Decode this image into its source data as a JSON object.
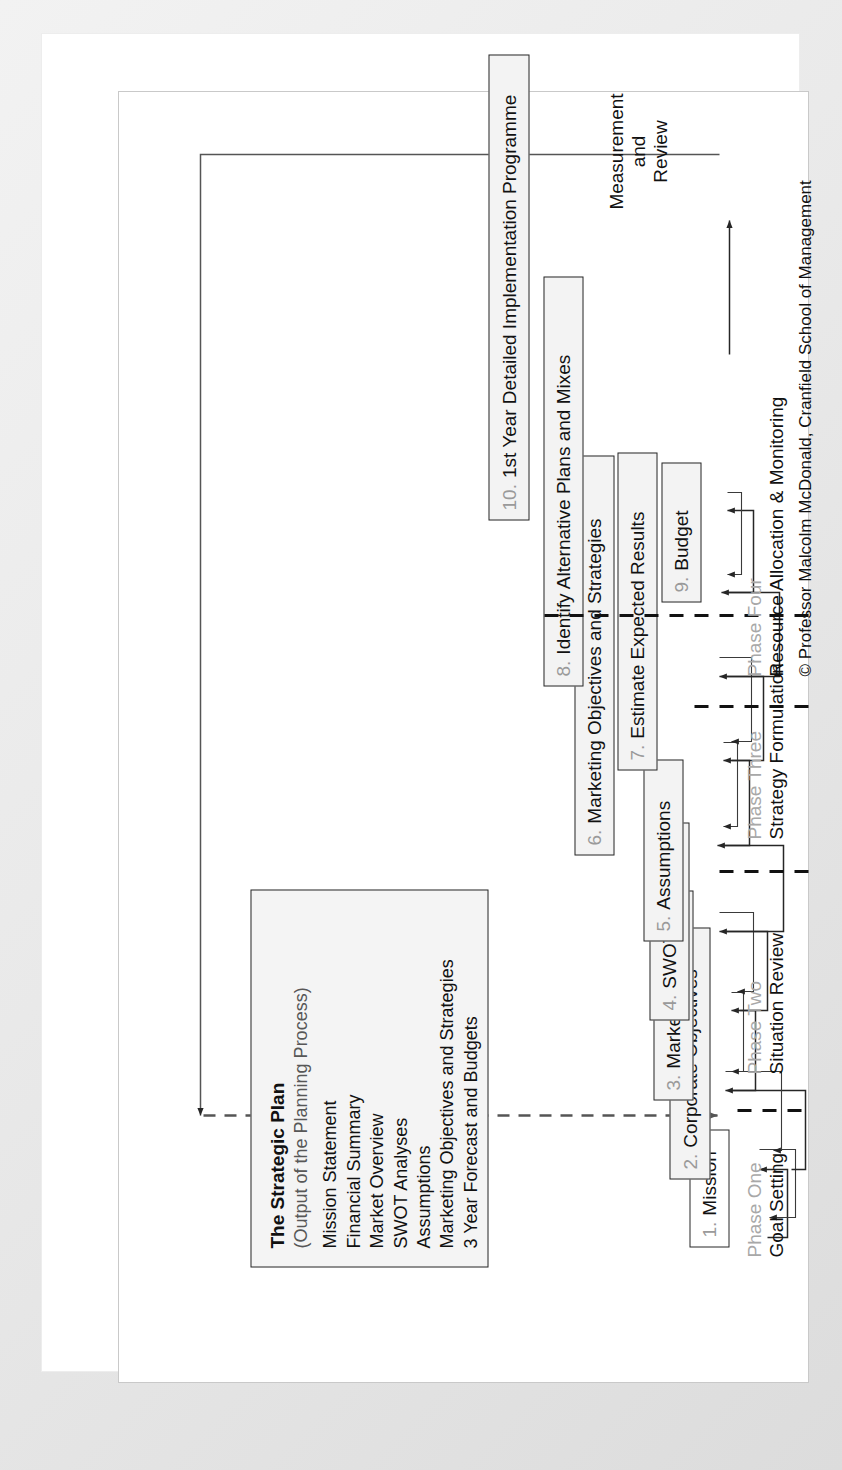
{
  "diagram": {
    "colors": {
      "box_fill": "#f3f3f3",
      "box_stroke": "#262626",
      "number_gray": "#9a9a9a",
      "phase_gray": "#a8a8a8",
      "text_black": "#111111",
      "page": "#ffffff",
      "scan_bg": "#e9e9e9"
    },
    "strategic_plan": {
      "title": "The Strategic Plan",
      "subtitle": "(Output of the Planning Process)",
      "items": [
        "Mission Statement",
        "Financial Summary",
        "Market Overview",
        "SWOT Analyses",
        "Assumptions",
        "Marketing Objectives and Strategies",
        "3 Year Forecast and Budgets"
      ]
    },
    "steps": [
      {
        "num": "1.",
        "label": "Mission"
      },
      {
        "num": "2.",
        "label": "Corporate Objectives"
      },
      {
        "num": "3.",
        "label": "Marketing Audit"
      },
      {
        "num": "4.",
        "label": "SWOT Analyses"
      },
      {
        "num": "5.",
        "label": "Assumptions"
      },
      {
        "num": "6.",
        "label": "Marketing Objectives and Strategies"
      },
      {
        "num": "7.",
        "label": "Estimate Expected Results"
      },
      {
        "num": "8.",
        "label": "Identify Alternative Plans and Mixes"
      },
      {
        "num": "9.",
        "label": "Budget"
      },
      {
        "num": "10.",
        "label": "1st Year Detailed Implementation Programme"
      }
    ],
    "phases": [
      {
        "name": "Phase One",
        "desc": "Goal Setting"
      },
      {
        "name": "Phase Two",
        "desc": "Situation Review"
      },
      {
        "name": "Phase Three",
        "desc": "Strategy Formulation"
      },
      {
        "name": "Phase Four",
        "desc": "Resource Allocation & Monitoring"
      }
    ],
    "feedback": {
      "line1": "Measurement",
      "line2": "and",
      "line3": "Review"
    },
    "copyright": "© Professor Malcolm McDonald, Cranfield School of Management"
  }
}
